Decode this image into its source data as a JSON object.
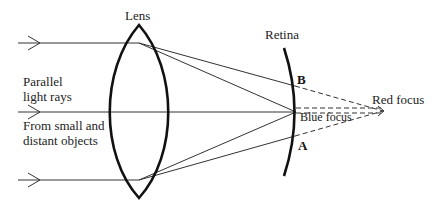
{
  "diagram": {
    "labels": {
      "lens": "Lens",
      "retina": "Retina",
      "parallel_line1": "Parallel",
      "parallel_line2": "light rays",
      "from_line1": "From small and",
      "from_line2": "distant objects",
      "point_b": "B",
      "point_a": "A",
      "red_focus": "Red focus",
      "blue_focus": "Blue focus"
    },
    "elements": {
      "incoming_rays": 3,
      "lens_type": "biconvex",
      "retina_shape": "arc",
      "dashed_lines": "extensions of red rays beyond retina to red focus"
    },
    "colors": {
      "line": "#222222",
      "background": "#ffffff"
    }
  }
}
